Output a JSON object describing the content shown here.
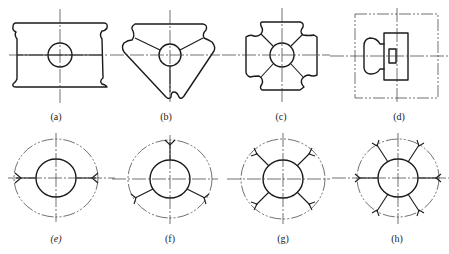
{
  "figure": {
    "panels": [
      {
        "id": "a",
        "label": "(a)",
        "shape": "rectangular body with rounded notches at four corners, central circle, center lines"
      },
      {
        "id": "b",
        "label": "(b)",
        "shape": "triangular body with three notches, central circle, radial lines"
      },
      {
        "id": "c",
        "label": "(c)",
        "shape": "cross-shaped body with four notches, central circle, diagonal lines"
      },
      {
        "id": "d",
        "label": "(d)",
        "shape": "square phantom frame containing a rounded knob and stepped rectangular block"
      },
      {
        "id": "e",
        "label": "(e)",
        "shape": "phantom outer circle, inner circle, two horizontal radial welds"
      },
      {
        "id": "f",
        "label": "(f)",
        "shape": "phantom outer circle, inner circle, three radial welds at 120 degrees"
      },
      {
        "id": "g",
        "label": "(g)",
        "shape": "phantom outer circle, inner circle, four diagonal radial welds"
      },
      {
        "id": "h",
        "label": "(h)",
        "shape": "phantom outer circle, inner circle, six radial welds"
      }
    ]
  },
  "colors": {
    "line": "#1a1a1a",
    "background": "#ffffff"
  }
}
